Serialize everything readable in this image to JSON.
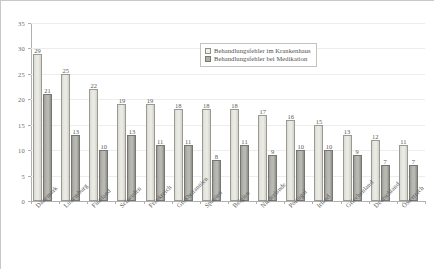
{
  "chart_data": {
    "type": "bar",
    "title": "",
    "subtitle": "",
    "xlabel": "",
    "ylabel": "",
    "ylim": [
      0,
      35
    ],
    "ytick_step": 5,
    "yticks": [
      "0",
      "5",
      "10",
      "15",
      "20",
      "25",
      "30",
      "35"
    ],
    "grid": true,
    "legend_position": "top-right",
    "categories": [
      "Dänemark",
      "Luxemburg",
      "Finnland",
      "Schweden",
      "Frankreich",
      "Großbritannien",
      "Spanien",
      "Belgien",
      "Niederlande",
      "Portugal",
      "Irland",
      "Griechenland",
      "Deutschland",
      "Österreich"
    ],
    "series": [
      {
        "name": "Behandlungsfehler im Krankenhaus",
        "color": "#ecece6",
        "values": [
          29,
          25,
          22,
          19,
          19,
          18,
          18,
          18,
          17,
          16,
          15,
          13,
          12,
          11
        ]
      },
      {
        "name": "Behandlungsfehler bei Medikation",
        "color": "#b0b0ab",
        "values": [
          21,
          13,
          10,
          13,
          11,
          11,
          8,
          11,
          9,
          10,
          10,
          9,
          7,
          7
        ]
      }
    ]
  },
  "legend": {
    "entries": [
      "Behandlungsfehler im Krankenhaus",
      "Behandlungsfehler bei Medikation"
    ]
  }
}
